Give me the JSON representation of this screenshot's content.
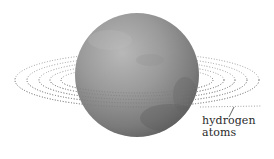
{
  "diagram": {
    "label": {
      "line1": "hydrogen",
      "line2": "atoms"
    },
    "colors": {
      "background": "#ffffff",
      "sphere_light": "#b4b4b4",
      "sphere_mid": "#8e8e8e",
      "sphere_dark": "#5e5e5e",
      "dots": "#8a8a8a",
      "text": "#2a2a2a"
    }
  }
}
